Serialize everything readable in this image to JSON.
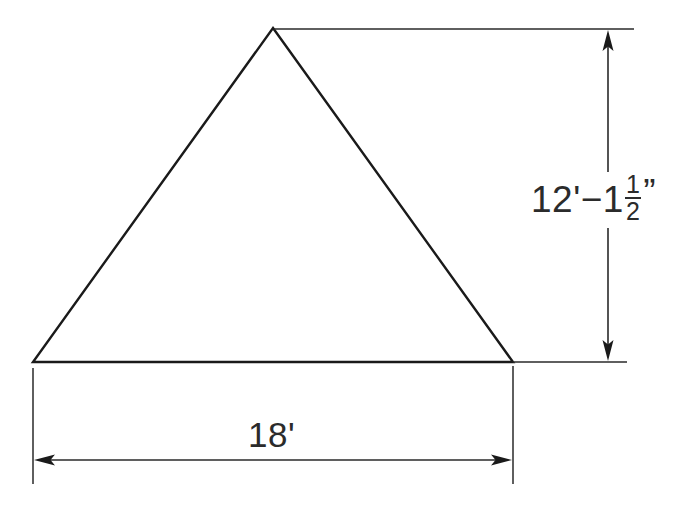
{
  "drawing": {
    "title": "Dimensioned triangle elevation",
    "shape": {
      "name": "triangle",
      "vertices": [
        {
          "label": "apex",
          "x": 273,
          "y": 28
        },
        {
          "label": "bottom-left",
          "x": 33,
          "y": 362
        },
        {
          "label": "bottom-right",
          "x": 513,
          "y": 362
        }
      ],
      "stroke_color": "#1a1a1a",
      "fill": "none"
    },
    "dimensions": [
      {
        "id": "height",
        "orientation": "vertical",
        "value_text": "12'-1 1/2\"",
        "feet": "12'",
        "separator": "−",
        "inches_whole": "1",
        "fraction_numerator": "1",
        "fraction_denominator": "2",
        "inch_mark": "”",
        "line_x": 608,
        "from_y": 29,
        "to_y": 362,
        "arrows": [
          "up",
          "down"
        ]
      },
      {
        "id": "base-width",
        "orientation": "horizontal",
        "value_text": "18'",
        "line_y": 460,
        "from_x": 33,
        "to_x": 513,
        "arrows": [
          "left",
          "right"
        ]
      }
    ],
    "extension_lines": [
      {
        "id": "top-extension",
        "x1": 274,
        "y1": 29,
        "x2": 634,
        "y2": 29
      },
      {
        "id": "right-base-extension",
        "x1": 513,
        "y1": 362,
        "x2": 627,
        "y2": 362
      },
      {
        "id": "left-vertical-extension",
        "x1": 33,
        "y1": 368,
        "x2": 33,
        "y2": 484
      },
      {
        "id": "right-vertical-extension",
        "x1": 513,
        "y1": 366,
        "x2": 513,
        "y2": 484
      }
    ],
    "colors": {
      "background": "#ffffff",
      "object_line": "#1a1a1a",
      "dimension_line": "#2a2a2a",
      "text": "#2b2b2b"
    }
  }
}
